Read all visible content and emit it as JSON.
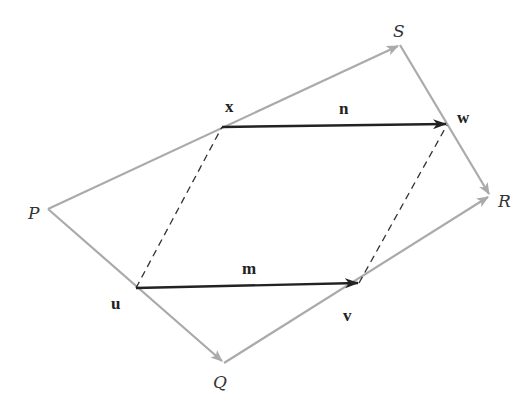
{
  "diagram": {
    "colors": {
      "outline": "#aaaaaa",
      "vector": "#222222",
      "dashed": "#333333",
      "background": "#ffffff"
    },
    "vertices": {
      "P": {
        "label": "P",
        "x": 48,
        "y": 209
      },
      "Q": {
        "label": "Q",
        "x": 224,
        "y": 363
      },
      "R": {
        "label": "R",
        "x": 490,
        "y": 196
      },
      "S": {
        "label": "S",
        "x": 400,
        "y": 45
      }
    },
    "midpoints": {
      "x": {
        "label": "x",
        "x": 222,
        "y": 127
      },
      "w": {
        "label": "w",
        "x": 447,
        "y": 125
      },
      "u": {
        "label": "u",
        "x": 136,
        "y": 288
      },
      "v": {
        "label": "v",
        "x": 359,
        "y": 283
      }
    },
    "vectors": {
      "m": {
        "label": "m",
        "from": "u",
        "to": "v"
      },
      "n": {
        "label": "n",
        "from": "x",
        "to": "w"
      }
    },
    "outline_arrows": [
      {
        "from": "P",
        "to": "S"
      },
      {
        "from": "S",
        "to": "R"
      },
      {
        "from": "P",
        "to": "Q"
      },
      {
        "from": "Q",
        "to": "R"
      }
    ],
    "dashed_segments": [
      {
        "from": "u",
        "to": "x"
      },
      {
        "from": "v",
        "to": "w"
      }
    ]
  }
}
